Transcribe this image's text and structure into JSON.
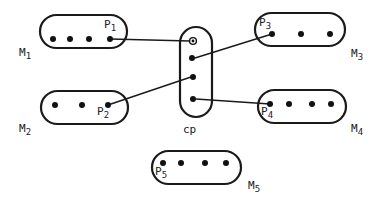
{
  "diagram": {
    "type": "module-pin connection diagram",
    "center": {
      "id": "cp",
      "label": "cp",
      "pins": 4
    },
    "modules": [
      {
        "id": "M1",
        "label_main": "M",
        "label_sub": "1",
        "pin_label_main": "P",
        "pin_label_sub": "1",
        "dot_count": 4,
        "connected_pin_index": 3
      },
      {
        "id": "M2",
        "label_main": "M",
        "label_sub": "2",
        "pin_label_main": "P",
        "pin_label_sub": "2",
        "dot_count": 3,
        "connected_pin_index": 2
      },
      {
        "id": "M3",
        "label_main": "M",
        "label_sub": "3",
        "pin_label_main": "P",
        "pin_label_sub": "3",
        "dot_count": 3,
        "connected_pin_index": 0
      },
      {
        "id": "M4",
        "label_main": "M",
        "label_sub": "4",
        "pin_label_main": "P",
        "pin_label_sub": "4",
        "dot_count": 4,
        "connected_pin_index": 0
      },
      {
        "id": "M5",
        "label_main": "M",
        "label_sub": "5",
        "pin_label_main": "P",
        "pin_label_sub": "5",
        "dot_count": 4,
        "connected_pin_index": 0
      }
    ],
    "connections": [
      {
        "from": "P1",
        "to": "cp.pin1"
      },
      {
        "from": "P3",
        "to": "cp.pin2"
      },
      {
        "from": "P2",
        "to": "cp.pin3"
      },
      {
        "from": "P4",
        "to": "cp.pin4"
      }
    ],
    "colors": {
      "stroke": "#1a1a1a",
      "background": "#ffffff"
    }
  }
}
